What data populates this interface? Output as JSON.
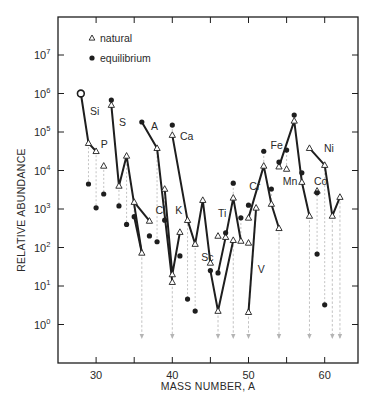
{
  "chart_data": {
    "type": "scatter",
    "title": "",
    "xlabel": "MASS NUMBER, A",
    "ylabel": "RELATIVE ABUNDANCE",
    "xlim": [
      25,
      64.5
    ],
    "ylim_log10": [
      -1.0,
      8.0
    ],
    "yscale": "log",
    "grid": false,
    "legend_position": "upper-left",
    "x_ticks": [
      30,
      35,
      40,
      45,
      50,
      55,
      60
    ],
    "x_tick_labels": [
      "30",
      "",
      "40",
      "",
      "50",
      "",
      "60"
    ],
    "y_ticks_log10": [
      0,
      1,
      2,
      3,
      4,
      5,
      6,
      7
    ],
    "y_tick_labels": [
      "10^0",
      "10^1",
      "10^2",
      "10^3",
      "10^4",
      "10^5",
      "10^6",
      "10^7"
    ],
    "legend": [
      {
        "marker": "triangle-open",
        "label": "natural"
      },
      {
        "marker": "circle-filled",
        "label": "equilibrium"
      }
    ],
    "series": [
      {
        "name": "natural",
        "marker": "triangle-open",
        "points": [
          {
            "A": 28,
            "log10": 6.0
          },
          {
            "A": 29,
            "log10": 4.71
          },
          {
            "A": 30,
            "log10": 4.5
          },
          {
            "A": 31,
            "log10": 4.12
          },
          {
            "A": 32,
            "log10": 5.7
          },
          {
            "A": 33,
            "log10": 3.6
          },
          {
            "A": 34,
            "log10": 4.38
          },
          {
            "A": 35,
            "log10": 3.18
          },
          {
            "A": 36,
            "log10": 1.86
          },
          {
            "A": 37,
            "log10": 2.69
          },
          {
            "A": 38,
            "log10": 4.58
          },
          {
            "A": 39,
            "log10": 3.52
          },
          {
            "A": 40,
            "log10": 1.3
          },
          {
            "A": 40,
            "log10": 1.1
          },
          {
            "A": 40,
            "log10": 4.92
          },
          {
            "A": 41,
            "log10": 2.4
          },
          {
            "A": 42,
            "log10": 2.71
          },
          {
            "A": 43,
            "log10": 2.09
          },
          {
            "A": 44,
            "log10": 3.23
          },
          {
            "A": 45,
            "log10": 1.6
          },
          {
            "A": 46,
            "log10": 2.3
          },
          {
            "A": 46,
            "log10": 0.35
          },
          {
            "A": 47,
            "log10": 2.27
          },
          {
            "A": 48,
            "log10": 3.29
          },
          {
            "A": 48,
            "log10": 2.19
          },
          {
            "A": 49,
            "log10": 2.17
          },
          {
            "A": 50,
            "log10": 2.12
          },
          {
            "A": 50,
            "log10": 0.32
          },
          {
            "A": 50,
            "log10": 2.77
          },
          {
            "A": 51,
            "log10": 3.03
          },
          {
            "A": 52,
            "log10": 4.12
          },
          {
            "A": 53,
            "log10": 3.13
          },
          {
            "A": 54,
            "log10": 2.5
          },
          {
            "A": 54,
            "log10": 4.1
          },
          {
            "A": 55,
            "log10": 4.04
          },
          {
            "A": 56,
            "log10": 5.29
          },
          {
            "A": 57,
            "log10": 3.7
          },
          {
            "A": 58,
            "log10": 2.82
          },
          {
            "A": 58,
            "log10": 4.58
          },
          {
            "A": 59,
            "log10": 3.47
          },
          {
            "A": 60,
            "log10": 4.14
          },
          {
            "A": 61,
            "log10": 2.82
          },
          {
            "A": 62,
            "log10": 3.31
          }
        ]
      },
      {
        "name": "equilibrium",
        "marker": "circle-filled",
        "points": [
          {
            "A": 28,
            "log10": 6.0
          },
          {
            "A": 29,
            "log10": 3.65
          },
          {
            "A": 30,
            "log10": 3.03
          },
          {
            "A": 31,
            "log10": 3.39
          },
          {
            "A": 32,
            "log10": 5.83
          },
          {
            "A": 33,
            "log10": 3.08
          },
          {
            "A": 34,
            "log10": 2.6
          },
          {
            "A": 35,
            "log10": 2.8
          },
          {
            "A": 36,
            "log10": 5.26
          },
          {
            "A": 37,
            "log10": 2.3
          },
          {
            "A": 38,
            "log10": 2.15
          },
          {
            "A": 39,
            "log10": 2.71
          },
          {
            "A": 40,
            "log10": 5.18
          },
          {
            "A": 41,
            "log10": 1.78
          },
          {
            "A": 42,
            "log10": 0.66
          },
          {
            "A": 43,
            "log10": 0.35
          },
          {
            "A": 45,
            "log10": 1.4
          },
          {
            "A": 46,
            "log10": 1.34
          },
          {
            "A": 47,
            "log10": 2.38
          },
          {
            "A": 48,
            "log10": 3.67
          },
          {
            "A": 49,
            "log10": 2.77
          },
          {
            "A": 50,
            "log10": 3.1
          },
          {
            "A": 52,
            "log10": 4.5
          },
          {
            "A": 53,
            "log10": 3.52
          },
          {
            "A": 54,
            "log10": 4.22
          },
          {
            "A": 55,
            "log10": 4.53
          },
          {
            "A": 56,
            "log10": 5.44
          },
          {
            "A": 57,
            "log10": 3.94
          },
          {
            "A": 59,
            "log10": 3.42
          },
          {
            "A": 59,
            "log10": 1.83
          },
          {
            "A": 60,
            "log10": 0.51
          }
        ]
      }
    ],
    "element_chains": [
      {
        "element": "Si",
        "label_at": {
          "A": 29.2,
          "log10": 5.55
        },
        "points": [
          [
            28,
            6.0
          ],
          [
            29,
            4.71
          ],
          [
            30,
            4.5
          ]
        ]
      },
      {
        "element": "P",
        "label_at": {
          "A": 30.6,
          "log10": 4.68
        },
        "points": []
      },
      {
        "element": "S",
        "label_at": {
          "A": 33.0,
          "log10": 5.25
        },
        "points": [
          [
            32,
            5.7
          ],
          [
            33,
            3.6
          ],
          [
            34,
            4.38
          ],
          [
            36,
            1.86
          ]
        ]
      },
      {
        "element": "Cl",
        "label_at": {
          "A": 37.8,
          "log10": 2.97
        },
        "points": [
          [
            35,
            3.18
          ],
          [
            37,
            2.69
          ]
        ]
      },
      {
        "element": "Cl-eq",
        "label_at": null,
        "points": [
          [
            35,
            2.8
          ],
          [
            36,
            1.86
          ]
        ]
      },
      {
        "element": "A",
        "label_at": {
          "A": 37.2,
          "log10": 5.16
        },
        "points": [
          [
            36,
            5.26
          ],
          [
            38,
            4.58
          ],
          [
            40,
            1.1
          ]
        ]
      },
      {
        "element": "K",
        "label_at": {
          "A": 40.4,
          "log10": 2.97
        },
        "points": [
          [
            39,
            3.52
          ],
          [
            40,
            1.3
          ],
          [
            41,
            2.4
          ]
        ]
      },
      {
        "element": "Ca",
        "label_at": {
          "A": 41.0,
          "log10": 4.9
        },
        "points": [
          [
            40,
            4.92
          ],
          [
            42,
            2.71
          ],
          [
            43,
            2.09
          ],
          [
            44,
            3.23
          ],
          [
            45,
            1.6
          ]
        ]
      },
      {
        "element": "Sc",
        "label_at": {
          "A": 43.8,
          "log10": 1.75
        },
        "points": [
          [
            45,
            1.4
          ],
          [
            46,
            0.35
          ],
          [
            48,
            2.19
          ]
        ]
      },
      {
        "element": "Ti",
        "label_at": {
          "A": 46.0,
          "log10": 2.9
        },
        "points": [
          [
            46,
            1.34
          ],
          [
            47,
            2.27
          ],
          [
            48,
            3.29
          ],
          [
            49,
            2.17
          ]
        ]
      },
      {
        "element": "V",
        "label_at": {
          "A": 51.2,
          "log10": 1.45
        },
        "points": [
          [
            50,
            0.32
          ],
          [
            51,
            3.03
          ]
        ]
      },
      {
        "element": "Cr",
        "label_at": {
          "A": 50.1,
          "log10": 3.6
        },
        "points": [
          [
            50,
            2.77
          ],
          [
            52,
            4.12
          ],
          [
            53,
            3.13
          ],
          [
            54,
            2.5
          ]
        ]
      },
      {
        "element": "Fe",
        "label_at": {
          "A": 52.9,
          "log10": 4.67
        },
        "points": [
          [
            54,
            4.1
          ],
          [
            56,
            5.29
          ],
          [
            57,
            3.7
          ],
          [
            58,
            2.82
          ]
        ]
      },
      {
        "element": "Mn",
        "label_at": {
          "A": 54.5,
          "log10": 3.72
        },
        "points": []
      },
      {
        "element": "Co",
        "label_at": {
          "A": 58.6,
          "log10": 3.72
        },
        "points": []
      },
      {
        "element": "Ni",
        "label_at": {
          "A": 59.9,
          "log10": 4.58
        },
        "points": [
          [
            58,
            4.58
          ],
          [
            60,
            4.14
          ],
          [
            61,
            2.82
          ],
          [
            62,
            3.31
          ]
        ]
      }
    ],
    "dashed_connectors": [
      [
        29,
        4.71,
        3.65
      ],
      [
        30,
        4.5,
        3.03
      ],
      [
        31,
        4.12,
        3.39
      ],
      [
        33,
        3.6,
        3.08
      ],
      [
        34,
        4.38,
        2.6
      ],
      [
        35,
        3.18,
        2.8
      ],
      [
        38,
        4.58,
        2.15
      ],
      [
        39,
        3.52,
        2.71
      ],
      [
        40,
        4.92,
        5.18
      ],
      [
        42,
        2.71,
        0.66
      ],
      [
        43,
        2.09,
        0.35
      ],
      [
        47,
        2.27,
        2.38
      ],
      [
        48,
        3.29,
        3.67
      ],
      [
        49,
        2.17,
        2.77
      ],
      [
        52,
        4.12,
        4.5
      ],
      [
        53,
        3.13,
        3.52
      ],
      [
        55,
        4.04,
        4.53
      ],
      [
        57,
        3.7,
        3.94
      ],
      [
        59,
        3.47,
        1.83
      ],
      [
        60,
        4.14,
        0.51
      ]
    ],
    "down_arrows": [
      {
        "A": 36,
        "from_log10": 1.86
      },
      {
        "A": 40,
        "from_log10": 1.1
      },
      {
        "A": 46,
        "from_log10": 0.35
      },
      {
        "A": 48,
        "from_log10": 2.19
      },
      {
        "A": 50,
        "from_log10": 0.32
      },
      {
        "A": 54,
        "from_log10": 2.5
      },
      {
        "A": 58,
        "from_log10": 2.82
      },
      {
        "A": 61,
        "from_log10": 2.82
      },
      {
        "A": 62,
        "from_log10": 3.31
      }
    ],
    "arrow_tip_log10": -0.35
  },
  "colors": {
    "ink": "#1e1e1e",
    "dashed": "#b4b4b4",
    "background": "#ffffff"
  }
}
